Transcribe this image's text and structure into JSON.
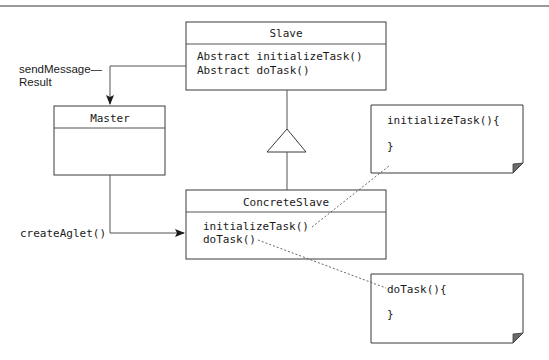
{
  "diagram": {
    "type": "UML class diagram (Master-Slave pattern)",
    "classes": {
      "slave": {
        "name": "Slave",
        "methods": [
          "Abstract initializeTask()",
          "Abstract doTask()"
        ]
      },
      "master": {
        "name": "Master",
        "methods": []
      },
      "concrete_slave": {
        "name": "ConcreteSlave",
        "methods": [
          "initializeTask()",
          "doTask()"
        ]
      }
    },
    "relations": {
      "send_message_label_line1": "sendMessage—",
      "send_message_label_line2": "Result",
      "create_aglet_label": "createAglet()",
      "inheritance": "ConcreteSlave extends Slave"
    },
    "notes": [
      {
        "line1": "initializeTask(){",
        "line2": "}"
      },
      {
        "line1": "doTask(){",
        "line2": "}"
      }
    ],
    "colors": {
      "stroke": "#3a3a3a",
      "fold": "#6b6b6b",
      "background": "#ffffff"
    }
  }
}
